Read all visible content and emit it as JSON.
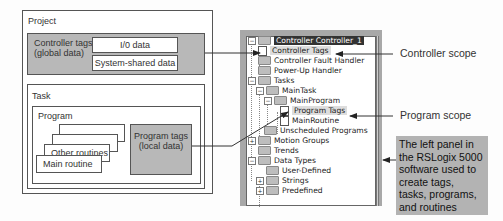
{
  "diagram": {
    "project": {
      "title": "Project",
      "controller_tags": {
        "label_line1": "Controller tags",
        "label_line2": "(global data)",
        "io_data": "I/0 data",
        "system_shared": "System-shared data"
      },
      "task": {
        "title": "Task",
        "program": {
          "title": "Program",
          "routines": [
            "Other routines",
            "Main routine"
          ],
          "program_tags_line1": "Program tags",
          "program_tags_line2": "(local data)"
        }
      }
    },
    "tree": {
      "items": [
        {
          "label": "Controller Controller_1",
          "level": 0,
          "expander": "-",
          "icon": "folder-icon",
          "selected": true
        },
        {
          "label": "Controller Tags",
          "level": 1,
          "icon": "tags-icon",
          "highlight": true
        },
        {
          "label": "Controller Fault Handler",
          "level": 1,
          "icon": "folder-icon"
        },
        {
          "label": "Power-Up Handler",
          "level": 1,
          "icon": "folder-icon"
        },
        {
          "label": "Tasks",
          "level": 0,
          "expander": "-",
          "icon": "folder-icon"
        },
        {
          "label": "MainTask",
          "level": 1,
          "expander": "-",
          "icon": "task-icon"
        },
        {
          "label": "MainProgram",
          "level": 2,
          "expander": "-",
          "icon": "program-icon"
        },
        {
          "label": "Program Tags",
          "level": 3,
          "icon": "tags-icon",
          "highlight": true
        },
        {
          "label": "MainRoutine",
          "level": 3,
          "icon": "routine-icon"
        },
        {
          "label": "Unscheduled Programs",
          "level": 1,
          "icon": "folder-icon"
        },
        {
          "label": "Motion Groups",
          "level": 0,
          "expander": "+",
          "icon": "folder-icon"
        },
        {
          "label": "Trends",
          "level": 0,
          "icon": "folder-icon"
        },
        {
          "label": "Data Types",
          "level": 0,
          "expander": "-",
          "icon": "folder-icon"
        },
        {
          "label": "User-Defined",
          "level": 1,
          "icon": "datatype-folder-icon"
        },
        {
          "label": "Strings",
          "level": 1,
          "expander": "+",
          "icon": "datatype-folder-icon"
        },
        {
          "label": "Predefined",
          "level": 1,
          "expander": "+",
          "icon": "datatype-folder-icon"
        }
      ]
    },
    "callouts": {
      "controller_scope": "Controller scope",
      "program_scope": "Program scope",
      "note_lines": [
        "The left panel in",
        "the RSLogix 5000",
        "software used to",
        "create tags,",
        "tasks, programs,",
        "and routines"
      ]
    }
  }
}
